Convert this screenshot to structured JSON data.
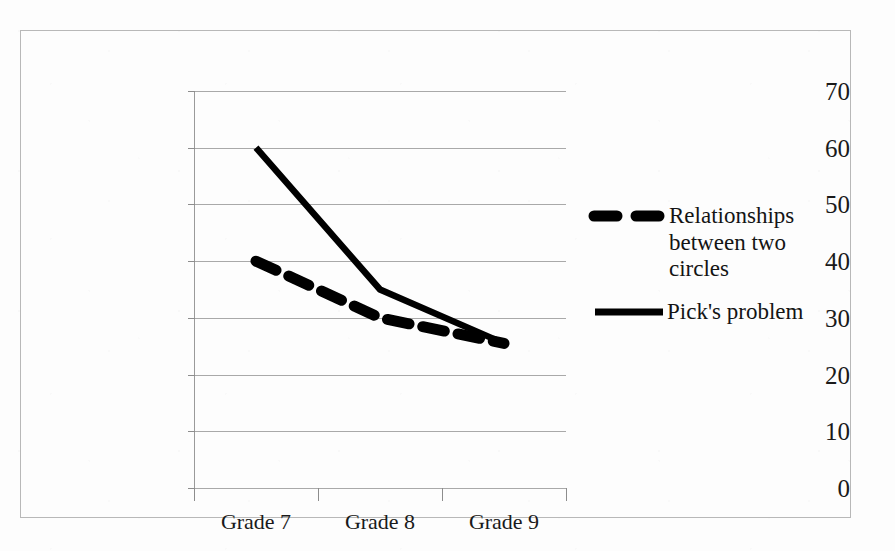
{
  "chart_data": {
    "type": "line",
    "title": "",
    "subtitle": "",
    "xlabel": "",
    "ylabel": "",
    "categories": [
      "Grade 7",
      "Grade 8",
      "Grade 9"
    ],
    "yticks": [
      "70",
      "60",
      "50",
      "40",
      "30",
      "20",
      "10",
      "0"
    ],
    "ylim": [
      0,
      70
    ],
    "ytick_step": 10,
    "grid": "horizontal",
    "legend_position": "right",
    "series": [
      {
        "name": "Relationships between two circles",
        "style": "dashed",
        "color": "#000000",
        "values": [
          40,
          30,
          25.5
        ]
      },
      {
        "name": "Pick's problem",
        "style": "solid",
        "color": "#000000",
        "values": [
          60,
          35,
          25.5
        ]
      }
    ]
  },
  "legend": {
    "entries": [
      {
        "label_line_1": "Relationships",
        "label_line_2": "between two",
        "label_line_3": "circles",
        "style": "dashed"
      },
      {
        "label_line_1": "Pick's problem",
        "style": "solid"
      }
    ]
  },
  "axes": {
    "y_tick_labels": [
      "70",
      "60",
      "50",
      "40",
      "30",
      "20",
      "10",
      "0"
    ],
    "x_tick_labels": [
      "Grade 7",
      "Grade 8",
      "Grade 9"
    ]
  },
  "colors": {
    "series_ink": "#000000",
    "gridline": "#a9a9a9",
    "frame": "#b8b8b8",
    "text": "#1a1a1a",
    "background": "#fdfdfd"
  }
}
